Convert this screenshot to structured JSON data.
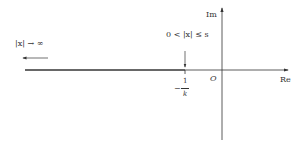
{
  "diagram": {
    "type": "complex-plane",
    "axes": {
      "real_label": "Re",
      "imag_label": "Im",
      "origin_label": "O"
    },
    "point_label": {
      "sign": "−",
      "numerator": "1",
      "denominator": "k"
    },
    "annotation_near": "0 < |x| ≤ s",
    "annotation_far": "|x| → ∞"
  }
}
